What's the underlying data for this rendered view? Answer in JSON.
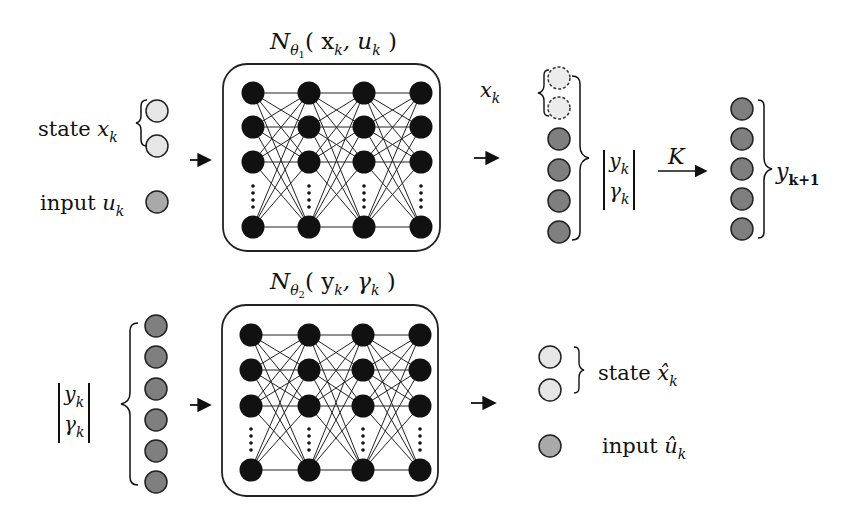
{
  "top": {
    "network_title": {
      "symbol": "N",
      "sub": "θ",
      "subsub": "1",
      "args": "( x",
      "arg1_sub": "k",
      "sep": ", u",
      "arg2_sub": "k",
      "close": " )"
    },
    "state_label": {
      "word": "state ",
      "var": "x",
      "sub": "k"
    },
    "input_label": {
      "word": "input ",
      "var": "u",
      "sub": "k"
    },
    "xk_label": {
      "var": "x",
      "sub": "k"
    },
    "vec_label": {
      "top_var": "y",
      "top_sub": "k",
      "bot_var": "γ",
      "bot_sub": "k"
    },
    "operator_label": "K",
    "output_label": {
      "var": "y",
      "sub": "k+1"
    }
  },
  "bottom": {
    "network_title": {
      "symbol": "N",
      "sub": "θ",
      "subsub": "2",
      "args": "( y",
      "arg1_sub": "k",
      "sep": ", γ",
      "arg2_sub": "k",
      "close": " )"
    },
    "vec_label": {
      "top_var": "y",
      "top_sub": "k",
      "bot_var": "γ",
      "bot_sub": "k"
    },
    "state_label": {
      "word": "state ",
      "var": "x̂",
      "sub": "k"
    },
    "input_label": {
      "word": "input ",
      "var": "û",
      "sub": "k"
    }
  },
  "colors": {
    "state_node": "#e6e6e6",
    "input_node": "#a9a9a9",
    "lifted_node": "#7f7f7f",
    "hidden_node": "#111111",
    "stroke": "#222222"
  }
}
